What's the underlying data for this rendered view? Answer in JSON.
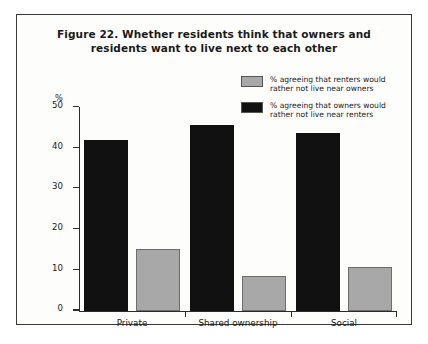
{
  "figure": {
    "title_line1": "Figure 22. Whether residents think that owners and",
    "title_line2": "residents want to live next to each other",
    "y_axis_title": "%"
  },
  "colors": {
    "series_gray": "#a8a8a8",
    "series_black": "#111111",
    "axis": "#2b2b2b",
    "border": "#3a3a3a",
    "background": "#fdfdfb"
  },
  "chart_data": {
    "type": "bar",
    "title": "Figure 22. Whether residents think that owners and residents want to live next to each other",
    "xlabel": "",
    "ylabel": "%",
    "ylim": [
      0,
      50
    ],
    "yticks": [
      0,
      10,
      20,
      30,
      40,
      50
    ],
    "ytick_labels": [
      "0",
      "10",
      "20",
      "30",
      "40",
      "50"
    ],
    "grid": false,
    "legend_position": "top-right",
    "categories": [
      "Private",
      "Shared ownership",
      "Social"
    ],
    "series": [
      {
        "name": "% agreeing that renters would rather not live near owners",
        "color": "#a8a8a8",
        "values": [
          15.2,
          8.5,
          10.8
        ]
      },
      {
        "name": "% agreeing that owners would rather not live near renters",
        "color": "#111111",
        "values": [
          42.0,
          45.5,
          43.5
        ]
      }
    ]
  },
  "legend": {
    "items": [
      {
        "label_line1": "% agreeing that renters would",
        "label_line2": "rather not live near owners",
        "color": "#a8a8a8"
      },
      {
        "label_line1": "% agreeing that owners would",
        "label_line2": "rather not live near renters",
        "color": "#111111"
      }
    ]
  }
}
